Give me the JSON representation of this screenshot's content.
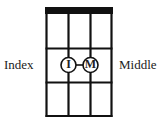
{
  "diagram": {
    "type": "ukulele-chord-diagram",
    "strings": 4,
    "frets": 3,
    "left_label": "Index",
    "right_label": "Middle",
    "fingers": [
      {
        "letter": "I",
        "string": 2,
        "fret": 2,
        "name": "Index"
      },
      {
        "letter": "M",
        "string": 3,
        "fret": 2,
        "name": "Middle"
      }
    ],
    "colors": {
      "line": "#111111",
      "background": "#ffffff"
    }
  }
}
